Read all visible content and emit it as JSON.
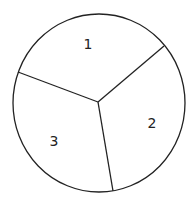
{
  "diagram": {
    "type": "circle-divided-into-sectors",
    "stroke_color": "#222222",
    "background": "#ffffff",
    "sectors": [
      {
        "label": "1"
      },
      {
        "label": "2"
      },
      {
        "label": "3"
      }
    ]
  }
}
